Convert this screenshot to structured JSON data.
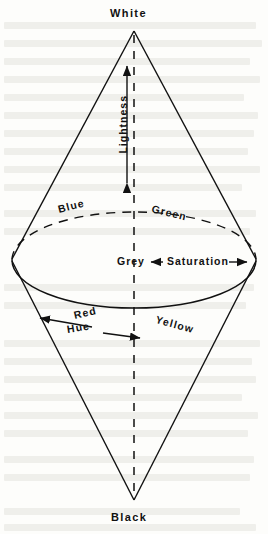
{
  "figure": {
    "poles": {
      "top_label": "White",
      "bottom_label": "Black"
    },
    "axes": [
      {
        "id": "lightness",
        "label": "Lightness",
        "orientation": "vertical",
        "arrow": "double",
        "rotation_deg": -90
      },
      {
        "id": "saturation",
        "label": "Saturation",
        "orientation": "horizontal",
        "arrow": "double",
        "rotation_deg": 0
      },
      {
        "id": "hue",
        "label": "Hue",
        "orientation": "arc",
        "arrow": "double",
        "rotation_deg": 0
      }
    ],
    "center_label": "Grey",
    "hues": [
      {
        "id": "blue",
        "label": "Blue",
        "half": "back",
        "rotation_deg": -14
      },
      {
        "id": "green",
        "label": "Green",
        "half": "back",
        "rotation_deg": 14
      },
      {
        "id": "red",
        "label": "Red",
        "half": "front",
        "rotation_deg": -13
      },
      {
        "id": "yellow",
        "label": "Yellow",
        "half": "front",
        "rotation_deg": 15
      }
    ],
    "colors": {
      "ink": "#111111",
      "page": "#fdfdfb",
      "ghost": "#6b6354"
    },
    "geometry": {
      "apex_top": [
        134,
        31
      ],
      "apex_bottom": [
        134,
        500
      ],
      "ellipse_center": [
        134,
        260
      ],
      "ellipse_rx": 122,
      "ellipse_ry": 48,
      "back_half_style": "dashed",
      "front_half_style": "solid",
      "center_axis_style": "dashed"
    }
  }
}
